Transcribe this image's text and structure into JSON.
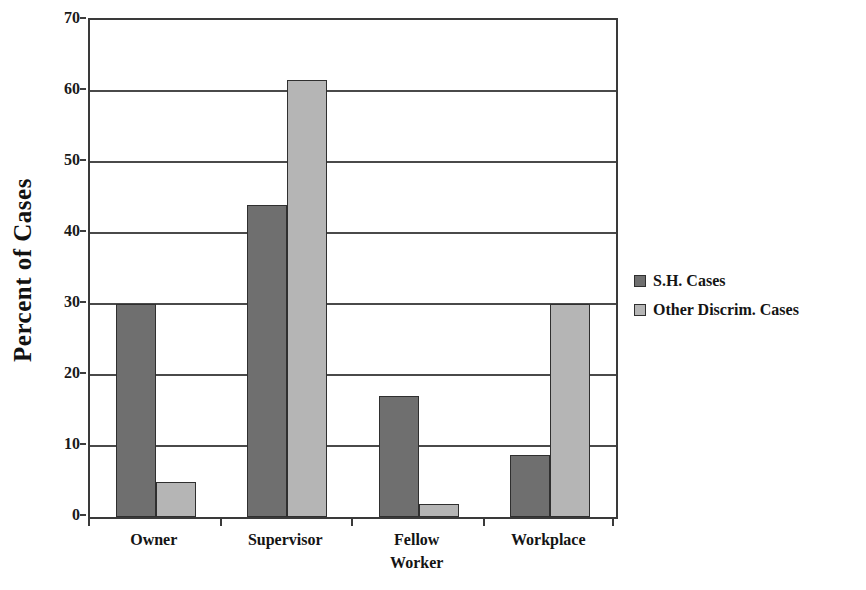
{
  "chart_data": {
    "type": "bar",
    "title": "",
    "subtitle": "",
    "xlabel": "",
    "ylabel": "Percent of Cases",
    "categories": [
      "Owner",
      "Supervisor",
      "Fellow Worker",
      "Workplace"
    ],
    "category_lines": [
      [
        "Owner"
      ],
      [
        "Supervisor"
      ],
      [
        "Fellow",
        "Worker"
      ],
      [
        "Workplace"
      ]
    ],
    "series": [
      {
        "name": "S.H. Cases",
        "color": "#6f6f6f",
        "values": [
          30,
          44,
          17,
          8.8
        ]
      },
      {
        "name": "Other Discrim. Cases",
        "color": "#b5b5b5",
        "values": [
          5,
          61.5,
          1.8,
          30
        ]
      }
    ],
    "ylim": [
      0,
      70
    ],
    "ytick_values": [
      0,
      10,
      20,
      30,
      40,
      50,
      60,
      70
    ],
    "ytick_labels": [
      "0",
      "10",
      "20",
      "30",
      "40",
      "50",
      "60",
      "70"
    ],
    "grid": true,
    "grid_axis": "y",
    "legend_position": "right",
    "bar_border_color": "#2f2f2f",
    "axis_color": "#3a3a3a",
    "background": "#ffffff"
  },
  "legend": {
    "entries": [
      {
        "label": "S.H. Cases",
        "swatch": "dark-gray-swatch-icon"
      },
      {
        "label": "Other Discrim. Cases",
        "swatch": "light-gray-swatch-icon"
      }
    ]
  }
}
